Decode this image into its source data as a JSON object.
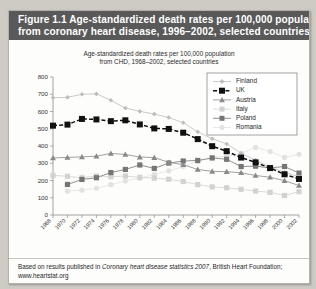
{
  "figure": {
    "title_line1": "Figure 1.1  Age-standardized death rates per 100,000 population",
    "title_line2": "from coronary heart disease, 1996–2002, selected countries",
    "title_bar_color": "#595959",
    "footer_prefix": "Based on results published in ",
    "footer_italic": "Coronary heart disease statistics 2007",
    "footer_suffix": ", British Heart Foundation;",
    "footer_line2": "www.heartstat.org"
  },
  "chart_data": {
    "type": "line",
    "title": "Age-standardized death rates per 100,000 population",
    "subtitle": "from CHD, 1968–2002, selected countries",
    "xlabel": "",
    "ylabel": "",
    "ylim": [
      0,
      800
    ],
    "ytick_step": 100,
    "yticks": [
      0,
      100,
      200,
      300,
      400,
      500,
      600,
      700,
      800
    ],
    "grid": false,
    "legend_position": "top-right",
    "x": [
      1968,
      1970,
      1972,
      1974,
      1976,
      1978,
      1980,
      1982,
      1984,
      1986,
      1988,
      1990,
      1992,
      1994,
      1996,
      1998,
      2000,
      2002
    ],
    "categories": [
      "1968",
      "1970",
      "1972",
      "1974",
      "1976",
      "1978",
      "1980",
      "1982",
      "1984",
      "1986",
      "1988",
      "1990",
      "1992",
      "1994",
      "1996",
      "1998",
      "2000",
      "2002"
    ],
    "series": [
      {
        "name": "Finland",
        "color": "#bdbdbd",
        "marker": "diamond",
        "values": [
          680,
          682,
          700,
          702,
          665,
          620,
          601,
          585,
          565,
          535,
          482,
          442,
          412,
          358,
          318,
          278,
          248,
          222
        ]
      },
      {
        "name": "UK",
        "color": "#111111",
        "marker": "square",
        "values": [
          518,
          524,
          557,
          554,
          544,
          549,
          525,
          502,
          499,
          477,
          440,
          399,
          370,
          333,
          305,
          272,
          236,
          209
        ]
      },
      {
        "name": "Austria",
        "color": "#8a8a8a",
        "marker": "triangle",
        "values": [
          331,
          334,
          337,
          341,
          357,
          351,
          336,
          333,
          305,
          292,
          264,
          253,
          251,
          245,
          229,
          219,
          199,
          171
        ]
      },
      {
        "name": "Italy",
        "color": "#d2d2d2",
        "marker": "square",
        "values": [
          230,
          224,
          216,
          226,
          222,
          226,
          218,
          214,
          207,
          194,
          176,
          163,
          158,
          149,
          139,
          131,
          113,
          135
        ]
      },
      {
        "name": "Poland",
        "color": "#767676",
        "marker": "square",
        "values": [
          null,
          177,
          206,
          216,
          246,
          264,
          290,
          270,
          301,
          313,
          316,
          331,
          323,
          281,
          283,
          273,
          281,
          243
        ]
      },
      {
        "name": "Romania",
        "color": "#e2e2e2",
        "marker": "circle",
        "values": [
          null,
          138,
          144,
          155,
          176,
          197,
          213,
          236,
          256,
          281,
          311,
          330,
          343,
          357,
          392,
          368,
          334,
          352
        ]
      }
    ]
  }
}
